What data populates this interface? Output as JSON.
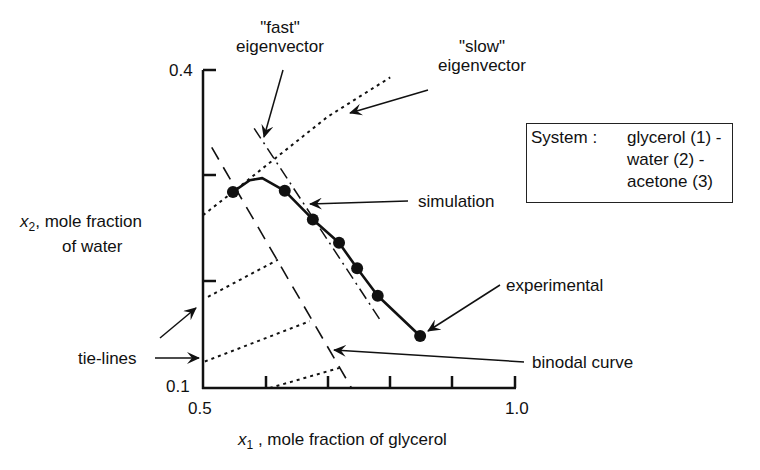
{
  "chart_data": {
    "type": "line",
    "title": "",
    "xlabel": "x1 , mole fraction of glycerol",
    "ylabel": "x2 , mole fraction of water",
    "xlim": [
      0.5,
      1.0
    ],
    "ylim": [
      0.1,
      0.4
    ],
    "x_tick_labels": [
      "0.5",
      "1.0"
    ],
    "x_ticks": [
      0.5,
      0.6,
      0.7,
      0.8,
      0.9,
      1.0
    ],
    "y_tick_labels": [
      "0.1",
      "0.4"
    ],
    "y_ticks": [
      0.1,
      0.2,
      0.3,
      0.4
    ],
    "grid": false,
    "series": [
      {
        "name": "experimental",
        "style": "markers",
        "x": [
          0.548,
          0.631,
          0.676,
          0.718,
          0.747,
          0.78,
          0.848
        ],
        "y": [
          0.285,
          0.286,
          0.259,
          0.237,
          0.213,
          0.187,
          0.149
        ]
      },
      {
        "name": "simulation",
        "style": "solid",
        "x": [
          0.548,
          0.575,
          0.595,
          0.631,
          0.676,
          0.718,
          0.747,
          0.78,
          0.848
        ],
        "y": [
          0.285,
          0.296,
          0.298,
          0.286,
          0.259,
          0.237,
          0.213,
          0.187,
          0.149
        ]
      },
      {
        "name": "binodal curve",
        "style": "long-dash",
        "x": [
          0.514,
          0.738
        ],
        "y": [
          0.327,
          0.1
        ]
      },
      {
        "name": "\"fast\" eigenvector",
        "style": "dash-dot",
        "x": [
          0.582,
          0.783
        ],
        "y": [
          0.345,
          0.165
        ]
      },
      {
        "name": "\"slow\" eigenvector",
        "style": "dotted",
        "x": [
          0.5,
          0.548,
          0.7,
          0.8
        ],
        "y": [
          0.263,
          0.285,
          0.356,
          0.393
        ]
      },
      {
        "name": "tie-lines",
        "style": "dotted",
        "segments": [
          {
            "x": [
              0.508,
              0.62
            ],
            "y": [
              0.186,
              0.221
            ]
          },
          {
            "x": [
              0.503,
              0.671
            ],
            "y": [
              0.125,
              0.163
            ]
          },
          {
            "x": [
              0.607,
              0.719
            ],
            "y": [
              0.1,
              0.119
            ]
          }
        ]
      }
    ],
    "annotations": [
      "\"fast\" eigenvector",
      "\"slow\" eigenvector",
      "simulation",
      "experimental",
      "binodal curve",
      "tie-lines"
    ],
    "legend": {
      "position": "right",
      "text": [
        "System : glycerol (1) -",
        "water (2) -",
        "acetone (3)"
      ]
    }
  },
  "labels": {
    "fast_q": "\"fast\"",
    "fast_e": "eigenvector",
    "slow_q": "\"slow\"",
    "slow_e": "eigenvector",
    "simulation": "simulation",
    "experimental": "experimental",
    "binodal": "binodal curve",
    "tielines": "tie-lines",
    "ylabel_var": "x",
    "ylabel_sub": "2",
    "ylabel_rest1": ", mole fraction",
    "ylabel_rest2": "of water",
    "xlabel_var": "x",
    "xlabel_sub": "1",
    "xlabel_rest": " , mole fraction of glycerol",
    "ytick_top": "0.4",
    "ytick_bottom": "0.1",
    "xtick_left": "0.5",
    "xtick_right": "1.0"
  },
  "legend": {
    "key": "System :",
    "line1": "glycerol (1) -",
    "line2": "water (2) -",
    "line3": "acetone (3)"
  }
}
